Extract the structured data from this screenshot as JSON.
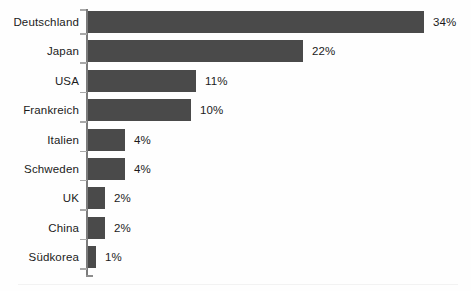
{
  "chart_data": {
    "type": "bar",
    "orientation": "horizontal",
    "title": "",
    "subtitle": "",
    "xlabel": "",
    "ylabel": "",
    "xlim": [
      0,
      40
    ],
    "grid": false,
    "legend": null,
    "bar_color": "#4a4a4a",
    "axis_color": "#7b7b7b",
    "text_color": "#1b1b1b",
    "background": "#ffffff",
    "value_suffix": "%",
    "categories": [
      "Deutschland",
      "Japan",
      "USA",
      "Frankreich",
      "Italien",
      "Schweden",
      "UK",
      "China",
      "Südkorea"
    ],
    "values": [
      34,
      22,
      11,
      10,
      4,
      4,
      2,
      2,
      1
    ],
    "labels": [
      "34%",
      "22%",
      "11%",
      "10%",
      "4%",
      "4%",
      "2%",
      "2%",
      "1%"
    ],
    "bar_pixel_widths": [
      336,
      215,
      108,
      103,
      37,
      37,
      17,
      17,
      8
    ]
  }
}
